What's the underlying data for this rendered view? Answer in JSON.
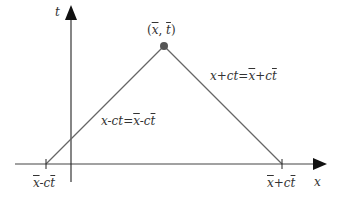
{
  "diagram": {
    "axes": {
      "x_label": "x",
      "t_label": "t",
      "color": "#222222"
    },
    "point": {
      "label_open": "(",
      "label_x": "x",
      "label_sep": ", ",
      "label_t": "t",
      "label_close": ")",
      "color": "#555555"
    },
    "lines": {
      "color": "#666666",
      "left_characteristic": {
        "lhs": "x-ct=",
        "rhs_x": "x",
        "rhs_mid": "-c",
        "rhs_t": "t"
      },
      "right_characteristic": {
        "lhs": "x+ct=",
        "rhs_x": "x",
        "rhs_mid": "+c",
        "rhs_t": "t"
      }
    },
    "ticks": {
      "left": {
        "x": "x",
        "mid": "-c",
        "t": "t"
      },
      "right": {
        "x": "x",
        "mid": "+c",
        "t": "t"
      }
    }
  }
}
